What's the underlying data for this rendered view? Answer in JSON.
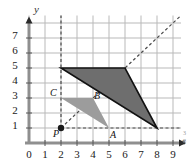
{
  "figure": {
    "name": "dilation-coordinate-plane",
    "axis_labels": {
      "x": "x",
      "y": "y"
    },
    "x_ticks": [
      "0",
      "1",
      "2",
      "3",
      "4",
      "5",
      "6",
      "7",
      "8",
      "9"
    ],
    "y_ticks": [
      "7",
      "6",
      "5",
      "4",
      "3",
      "2",
      "1"
    ],
    "corner_note": "3",
    "corner_note2": "8"
  },
  "colors": {
    "grid": "#b9b9b9",
    "axis": "#8f8f8f",
    "preimage_fill": "#9c9c9c",
    "image_fill": "#6e6e6e",
    "image_stroke": "#121212",
    "dash": "#4a4a4a",
    "point": "#1a1a1a"
  },
  "chart_data": {
    "type": "scatter",
    "title": "",
    "xlabel": "x",
    "ylabel": "y",
    "xlim": [
      0,
      9.5
    ],
    "ylim": [
      0,
      8.5
    ],
    "grid": true,
    "legend": "none",
    "x_ticks": [
      0,
      1,
      2,
      3,
      4,
      5,
      6,
      7,
      8,
      9
    ],
    "y_ticks": [
      1,
      2,
      3,
      4,
      5,
      6,
      7
    ],
    "points": [
      {
        "label": "P",
        "x": 2,
        "y": 1,
        "marker": "filled-circle",
        "label_pos": "below-left"
      },
      {
        "label": "A",
        "x": 5,
        "y": 1,
        "marker": "none",
        "label_pos": "below"
      },
      {
        "label": "B",
        "x": 4,
        "y": 3,
        "marker": "none",
        "label_pos": "above-right"
      },
      {
        "label": "C",
        "x": 2,
        "y": 3,
        "marker": "none",
        "label_pos": "left"
      }
    ],
    "polygons": [
      {
        "name": "preimage-triangle-ABC",
        "vertices": [
          [
            5,
            1
          ],
          [
            4,
            3
          ],
          [
            2,
            3
          ]
        ],
        "fill": "#9c9c9c",
        "stroke": "none"
      },
      {
        "name": "image-triangle",
        "vertices": [
          [
            8,
            1
          ],
          [
            6,
            5
          ],
          [
            2,
            5
          ]
        ],
        "fill": "#6e6e6e",
        "stroke": "#121212"
      }
    ],
    "dashed_lines": [
      {
        "name": "ray-through-P-slope-1",
        "from": [
          2,
          1
        ],
        "to": [
          9.5,
          8.5
        ]
      },
      {
        "name": "horizontal-from-P",
        "from": [
          2,
          1
        ],
        "to": [
          9.5,
          1
        ]
      },
      {
        "name": "vertical-from-P",
        "from": [
          2,
          1
        ],
        "to": [
          2,
          8.5
        ]
      }
    ],
    "center_of_dilation": [
      2,
      1
    ],
    "scale_factor": 2
  }
}
